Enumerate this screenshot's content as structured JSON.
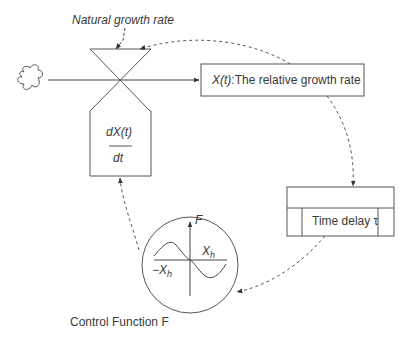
{
  "labels": {
    "natural_growth_rate": "Natural growth rate",
    "relative_growth_rate_var": "X(t)",
    "relative_growth_rate_text": ":The relative growth rate",
    "derivative_numerator": "dX(t)",
    "derivative_denominator": "dt",
    "time_delay": "Time delay τ",
    "control_function": "Control Function F",
    "axis_f": "F",
    "x_h_pos": "X",
    "x_h_neg": "−X",
    "subscript_h": "h"
  },
  "icons": {
    "source": "cloud-icon",
    "valve": "hourglass-valve-icon"
  },
  "colors": {
    "stroke": "#4a4a4a",
    "text": "#333333",
    "background": "#ffffff"
  }
}
